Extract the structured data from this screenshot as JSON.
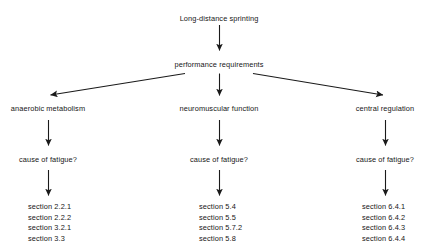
{
  "diagram": {
    "type": "flowchart",
    "orientation": "top-down",
    "background_color": "#ffffff",
    "text_color": "#161616",
    "arrow_color": "#1a1a1a",
    "root": {
      "label": "Long-distance sprinting"
    },
    "level2": {
      "label": "performance requirements"
    },
    "branches": [
      {
        "label": "anaerobic metabolism",
        "question": "cause of fatigue?",
        "sections": [
          "section 2.2.1",
          "section 2.2.2",
          "section 3.2.1",
          "section 3.3"
        ]
      },
      {
        "label": "neuromuscular function",
        "question": "cause of fatigue?",
        "sections": [
          "section 5.4",
          "section 5.5",
          "section 5.7.2",
          "section 5.8"
        ]
      },
      {
        "label": "central regulation",
        "question": "cause of fatigue?",
        "sections": [
          "section 6.4.1",
          "section 6.4.2",
          "section 6.4.3",
          "section 6.4.4"
        ]
      }
    ],
    "connectors": [
      {
        "name": "root-to-requirements",
        "shape": "vertical-arrow"
      },
      {
        "name": "requirements-to-anaerobic",
        "shape": "diagonal-arrow-left"
      },
      {
        "name": "requirements-to-neuromuscular",
        "shape": "vertical-arrow"
      },
      {
        "name": "requirements-to-central",
        "shape": "diagonal-arrow-right"
      },
      {
        "name": "anaerobic-to-question",
        "shape": "vertical-arrow"
      },
      {
        "name": "neuromuscular-to-question",
        "shape": "vertical-arrow"
      },
      {
        "name": "central-to-question",
        "shape": "vertical-arrow"
      },
      {
        "name": "question-to-sections-left",
        "shape": "vertical-arrow"
      },
      {
        "name": "question-to-sections-middle",
        "shape": "vertical-arrow"
      },
      {
        "name": "question-to-sections-right",
        "shape": "vertical-arrow"
      }
    ]
  }
}
